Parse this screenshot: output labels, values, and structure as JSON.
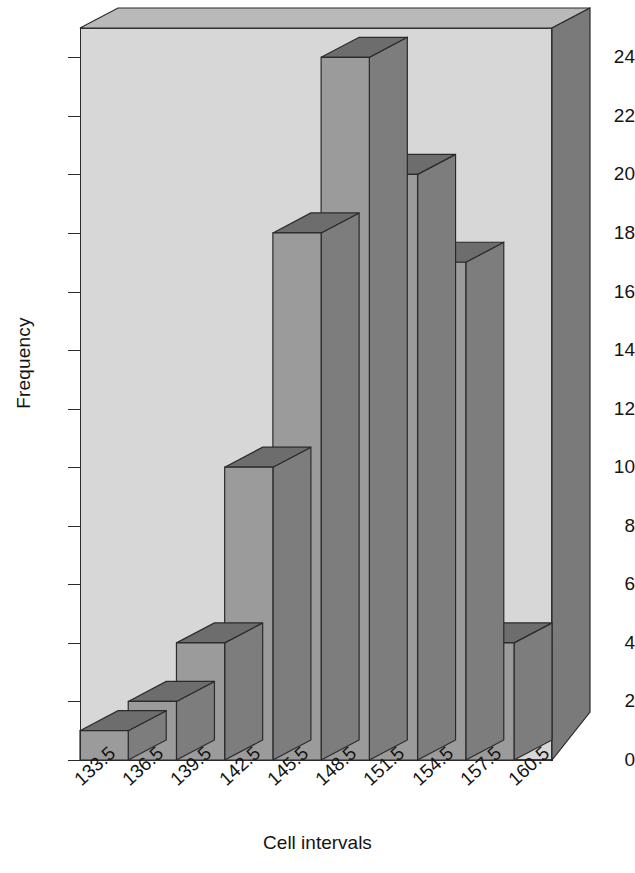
{
  "chart_data": {
    "type": "bar",
    "title": "",
    "subtitle": "",
    "xlabel": "Cell intervals",
    "ylabel": "Frequency",
    "style": "3d-histogram",
    "grid": false,
    "legend": null,
    "ylim": [
      0,
      25
    ],
    "ytick_labels": [
      "0",
      "2",
      "4",
      "6",
      "8",
      "10",
      "12",
      "14",
      "16",
      "18",
      "20",
      "22",
      "24"
    ],
    "ytick_values": [
      0,
      2,
      4,
      6,
      8,
      10,
      12,
      14,
      16,
      18,
      20,
      22,
      24
    ],
    "xtick_labels": [
      "133.5",
      "136.5",
      "139.5",
      "142.5",
      "145.5",
      "148.5",
      "151.5",
      "154.5",
      "157.5",
      "160.5"
    ],
    "bin_edges": [
      133.5,
      136.5,
      139.5,
      142.5,
      145.5,
      148.5,
      151.5,
      154.5,
      157.5,
      160.5
    ],
    "categories": [
      "133.5-136.5",
      "136.5-139.5",
      "139.5-142.5",
      "142.5-145.5",
      "145.5-148.5",
      "148.5-151.5",
      "151.5-154.5",
      "154.5-157.5",
      "157.5-160.5"
    ],
    "values": [
      1,
      2,
      4,
      10,
      18,
      24,
      20,
      17,
      4
    ],
    "colors": {
      "bar_face": "#9b9b9b",
      "bar_top": "#6d6d6d",
      "bar_side": "#7d7d7d",
      "wall_back": "#d7d7d7",
      "wall_top": "#b9b9b9",
      "wall_right": "#7a7a7a",
      "outline": "#2b2b2b",
      "text": "#141414",
      "background": "#ffffff"
    }
  },
  "axes": {
    "y_title": "Frequency",
    "x_title": "Cell intervals"
  }
}
